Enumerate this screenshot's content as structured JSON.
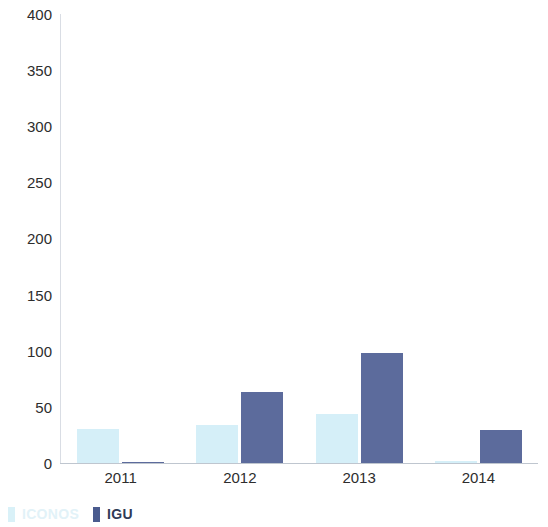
{
  "chart_data": {
    "type": "bar",
    "title": "",
    "subtitle": "",
    "xlabel": "",
    "ylabel": "",
    "categories": [
      "2011",
      "2012",
      "2013",
      "2014"
    ],
    "series": [
      {
        "name": "ICONOS",
        "color": "#d5eff8",
        "values": [
          30,
          34,
          44,
          2
        ]
      },
      {
        "name": "IGU",
        "color": "#5c6b9c",
        "values": [
          1,
          63,
          98,
          29
        ]
      }
    ],
    "ylim": [
      0,
      400
    ],
    "yticks": [
      0,
      50,
      100,
      150,
      200,
      250,
      300,
      350,
      400
    ],
    "ytick_labels": [
      "0",
      "50",
      "100",
      "150",
      "200",
      "250",
      "300",
      "350",
      "400"
    ],
    "grid": false,
    "legend_position": "bottom-left"
  },
  "axis": {
    "y_ticks": [
      "400",
      "350",
      "300",
      "250",
      "200",
      "150",
      "100",
      "50",
      "0"
    ],
    "x_ticks": [
      "2011",
      "2012",
      "2013",
      "2014"
    ]
  },
  "legend": {
    "items": [
      {
        "label": "ICONOS",
        "color": "#d9f1f8"
      },
      {
        "label": "IGU",
        "color": "#4a5b8e"
      }
    ]
  }
}
